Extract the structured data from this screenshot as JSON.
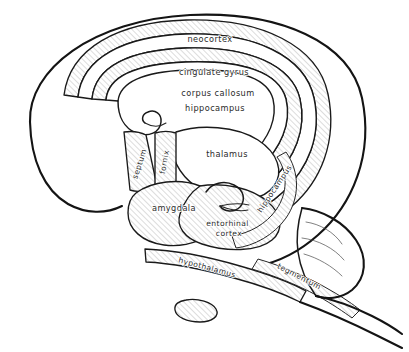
{
  "figure": {
    "style": "hand-drawn line art with diagonal hatching",
    "background_color": "#ffffff",
    "ink_color": "#141414",
    "hatch_color": "#9a9a9a",
    "label_color": "#2b2b2b"
  },
  "labels": [
    {
      "id": "neocortex",
      "text": "neocortex",
      "x": 210,
      "y": 39,
      "rotation": 0,
      "lines": [
        "neocortex"
      ]
    },
    {
      "id": "cingulate-gyrus",
      "text": "cingulate gyrus",
      "x": 214,
      "y": 72,
      "rotation": 0,
      "lines": [
        "cingulate gyrus"
      ]
    },
    {
      "id": "corpus-callosum",
      "text": "corpus callosum",
      "x": 218,
      "y": 93,
      "rotation": 0,
      "lines": [
        "corpus callosum"
      ]
    },
    {
      "id": "hippocampus-top",
      "text": "hippocampus",
      "x": 215,
      "y": 108,
      "rotation": 0,
      "lines": [
        "hippocampus"
      ]
    },
    {
      "id": "thalamus",
      "text": "thalamus",
      "x": 227,
      "y": 154,
      "rotation": 0,
      "lines": [
        "thalamus"
      ]
    },
    {
      "id": "septum",
      "text": "septum",
      "x": 140,
      "y": 164,
      "rotation": -72,
      "lines": [
        "septum"
      ]
    },
    {
      "id": "fornix",
      "text": "fornix",
      "x": 165,
      "y": 162,
      "rotation": -80,
      "lines": [
        "fornix"
      ]
    },
    {
      "id": "amygdala",
      "text": "amygdala",
      "x": 174,
      "y": 208,
      "rotation": 0,
      "lines": [
        "amygdala"
      ]
    },
    {
      "id": "entorhinal-cortex",
      "text": "entorhinal cortex",
      "x": 229,
      "y": 228,
      "rotation": 0,
      "lines": [
        "entorhinal",
        "cortex"
      ]
    },
    {
      "id": "hippocampus-right",
      "text": "hippocampus",
      "x": 275,
      "y": 189,
      "rotation": -56,
      "lines": [
        "hippocampus"
      ]
    },
    {
      "id": "hypothalamus",
      "text": "hypothalamus",
      "x": 207,
      "y": 268,
      "rotation": 15,
      "lines": [
        "hypothalamus"
      ]
    },
    {
      "id": "tegmentum",
      "text": "tegmentum",
      "x": 299,
      "y": 277,
      "rotation": 27,
      "lines": [
        "tegmentum"
      ]
    }
  ],
  "structures": [
    {
      "id": "neocortex-outline",
      "name": "neocortex",
      "hatched": false
    },
    {
      "id": "cingulate-band",
      "name": "cingulate gyrus",
      "hatched": true
    },
    {
      "id": "corpus-callosum",
      "name": "corpus callosum",
      "hatched": false
    },
    {
      "id": "hippocampal-band",
      "name": "hippocampus",
      "hatched": true
    },
    {
      "id": "thalamus-body",
      "name": "thalamus",
      "hatched": false
    },
    {
      "id": "septum-band",
      "name": "septum",
      "hatched": true
    },
    {
      "id": "fornix-band",
      "name": "fornix",
      "hatched": true
    },
    {
      "id": "amygdala-body",
      "name": "amygdala",
      "hatched": true
    },
    {
      "id": "entorhinal-body",
      "name": "entorhinal cortex",
      "hatched": true
    },
    {
      "id": "hypothalamus-band",
      "name": "hypothalamus",
      "hatched": true
    },
    {
      "id": "tegmentum-band",
      "name": "tegmentum",
      "hatched": true
    },
    {
      "id": "cerebellum-body",
      "name": "cerebellum",
      "hatched": false
    },
    {
      "id": "brainstem-tail",
      "name": "brainstem",
      "hatched": false
    },
    {
      "id": "pituitary-oval",
      "name": "pituitary",
      "hatched": true
    }
  ]
}
